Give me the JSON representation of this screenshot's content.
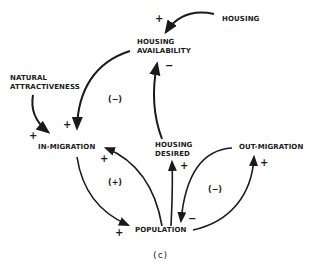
{
  "diagram": {
    "type": "causal-loop",
    "caption": "(c)",
    "nodes": {
      "housing": "HOUSING",
      "housing_availability_line1": "HOUSING",
      "housing_availability_line2": "AVAILABILITY",
      "natural_attractiveness_line1": "NATURAL",
      "natural_attractiveness_line2": "ATTRACTIVENESS",
      "in_migration": "IN-MIGRATION",
      "housing_desired_line1": "HOUSING",
      "housing_desired_line2": "DESIRED",
      "out_migration": "OUT-MIGRATION",
      "population": "POPULATION"
    },
    "link_signs": {
      "housing_to_availability": "+",
      "desired_to_availability": "−",
      "availability_to_inmigration": "+",
      "natural_to_inmigration": "+",
      "population_to_inmigration": "+",
      "inmigration_to_population": "+",
      "population_to_desired": "+",
      "population_to_outmigration": "+",
      "outmigration_to_population": "−"
    },
    "loops": {
      "left_upper": "(−)",
      "left_lower": "(+)",
      "right": "(−)"
    },
    "colors": {
      "ink": "#1a1a1a",
      "background": "#ffffff"
    }
  }
}
